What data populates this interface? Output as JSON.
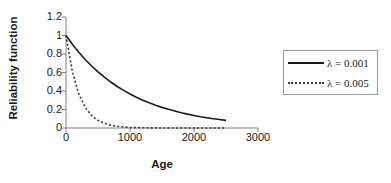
{
  "chart_data": {
    "type": "line",
    "title": "",
    "xlabel": "Age",
    "ylabel": "Reliability function",
    "xlim": [
      0,
      3000
    ],
    "ylim": [
      0,
      1.2
    ],
    "xticks": [
      "0",
      "1000",
      "2000",
      "3000"
    ],
    "xtick_values": [
      0,
      1000,
      2000,
      3000
    ],
    "yticks": [
      "0",
      "0.2",
      "0.4",
      "0.6",
      "0.8",
      "1",
      "1.2"
    ],
    "ytick_values": [
      0,
      0.2,
      0.4,
      0.6,
      0.8,
      1,
      1.2
    ],
    "grid": false,
    "legend_position": "right",
    "series": [
      {
        "name": "λ = 0.001",
        "style": "solid",
        "color": "#1a1a1a",
        "x": [
          0,
          100,
          200,
          300,
          400,
          500,
          600,
          700,
          800,
          900,
          1000,
          1100,
          1200,
          1300,
          1400,
          1500,
          1600,
          1700,
          1800,
          1900,
          2000,
          2100,
          2200,
          2300,
          2400,
          2500
        ],
        "values": [
          1.0,
          0.905,
          0.819,
          0.741,
          0.67,
          0.607,
          0.549,
          0.497,
          0.449,
          0.407,
          0.368,
          0.333,
          0.301,
          0.273,
          0.247,
          0.223,
          0.202,
          0.183,
          0.165,
          0.15,
          0.135,
          0.122,
          0.111,
          0.1,
          0.091,
          0.082
        ]
      },
      {
        "name": "λ = 0.005",
        "style": "dotted",
        "color": "#3a3a3a",
        "x": [
          0,
          100,
          200,
          300,
          400,
          500,
          600,
          700,
          800,
          900,
          1000,
          1100,
          1200,
          1300,
          1400,
          1500,
          1600,
          1700,
          1800,
          1900,
          2000,
          2100,
          2200,
          2300,
          2400,
          2500
        ],
        "values": [
          1.0,
          0.607,
          0.368,
          0.223,
          0.135,
          0.082,
          0.05,
          0.03,
          0.018,
          0.011,
          0.0067,
          0.0041,
          0.0025,
          0.0015,
          0.0009,
          0.00055,
          0.00034,
          0.0002,
          0.00012,
          7e-05,
          4.5e-05,
          2.7e-05,
          1.7e-05,
          1e-05,
          6e-06,
          3.7e-06
        ]
      }
    ]
  },
  "axes": {
    "y_title": "Reliability function",
    "x_title": "Age",
    "y_tick_labels": [
      "1.2",
      "1",
      "0.8",
      "0.6",
      "0.4",
      "0.2",
      "0"
    ],
    "x_tick_labels": [
      "0",
      "1000",
      "2000",
      "3000"
    ]
  },
  "legend": {
    "entries": [
      {
        "label": "λ = 0.001",
        "style": "solid"
      },
      {
        "label": "λ = 0.005",
        "style": "dotted"
      }
    ]
  },
  "colors": {
    "series_solid": "#1a1a1a",
    "series_dotted": "#3a3a3a",
    "axis": "#808080",
    "legend_border": "#9a9a9a",
    "background": "#ffffff",
    "text": "#1a1a1a"
  }
}
